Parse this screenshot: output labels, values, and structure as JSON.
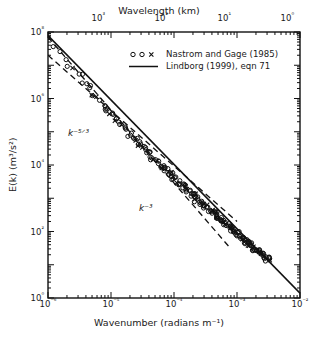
{
  "figure": {
    "top_axis_title": "Wavelength  (km)",
    "bottom_axis_title": "Wavenumber  (radians m⁻¹)",
    "y_axis_title": "E(k) (m³/s²)"
  },
  "legend": {
    "entries": [
      {
        "key": "open-circles-and-cross",
        "label": "Nastrom and Gage (1985)"
      },
      {
        "key": "solid-line",
        "label": "Lindborg (1999), eqn 71"
      }
    ]
  },
  "annotations": [
    {
      "name": "slope-label-k-minus-five-thirds",
      "text": "k⁻⁵ᐟ³",
      "x": 68,
      "y": 128
    },
    {
      "name": "slope-label-k-minus-three",
      "text": "k⁻³",
      "x": 139,
      "y": 203
    }
  ],
  "chart_data": {
    "type": "scatter",
    "title": "",
    "xlabel": "Wavenumber  (radians m⁻¹)",
    "ylabel": "E(k) (m³/s²)",
    "xscale": "log",
    "yscale": "log",
    "xlim": [
      1e-06,
      0.01
    ],
    "ylim": [
      1.0,
      100000000.0
    ],
    "grid": false,
    "legend_position": "top-right-inside",
    "x_ticks": [
      "10⁻⁶",
      "10⁻⁵",
      "10⁻⁴",
      "10⁻³",
      "10⁻²"
    ],
    "x_tick_values": [
      1e-06,
      1e-05,
      0.0001,
      0.001,
      0.01
    ],
    "y_ticks": [
      "10⁸",
      "10⁶",
      "10⁴",
      "10²",
      "10⁰"
    ],
    "y_tick_values": [
      100000000.0,
      1000000.0,
      10000.0,
      100.0,
      1.0
    ],
    "secondary_x_axis": {
      "label": "Wavelength  (km)",
      "ticks": [
        "10³",
        "10²",
        "10¹",
        "10⁰"
      ],
      "tick_values": [
        1000,
        100,
        10,
        1
      ],
      "relation": "wavelength_km = 2*pi/(1000*k)"
    },
    "series": [
      {
        "name": "Nastrom and Gage (1985)",
        "marker": "open circle / cross",
        "type": "scatter",
        "points": [
          [
            1e-06,
            63000000.0
          ],
          [
            1.2e-06,
            43000000.0
          ],
          [
            1.5e-06,
            26000000.0
          ],
          [
            1.8e-06,
            17000000.0
          ],
          [
            2.2e-06,
            11000000.0
          ],
          [
            2.6e-06,
            7400000.0
          ],
          [
            3.2e-06,
            4600000.0
          ],
          [
            3.8e-06,
            3100000.0
          ],
          [
            4.5e-06,
            2100000.0
          ],
          [
            5.4e-06,
            1400000.0
          ],
          [
            6.3e-06,
            960000.0
          ],
          [
            7.5e-06,
            660000.0
          ],
          [
            8.9e-06,
            450000.0
          ],
          [
            1e-05,
            340000.0
          ],
          [
            1.2e-05,
            240000.0
          ],
          [
            1.4e-05,
            170000.0
          ],
          [
            1.7e-05,
            120000.0
          ],
          [
            2e-05,
            82000.0
          ],
          [
            2.4e-05,
            58000.0
          ],
          [
            2.8e-05,
            42000.0
          ],
          [
            3.3e-05,
            31000.0
          ],
          [
            3.9e-05,
            23000.0
          ],
          [
            4.6e-05,
            17000.0
          ],
          [
            5.4e-05,
            13000.0
          ],
          [
            6.4e-05,
            9400.0
          ],
          [
            7.5e-05,
            7100.0
          ],
          [
            8.8e-05,
            5300.0
          ],
          [
            0.0001,
            4100.0
          ],
          [
            0.00012,
            3000.0
          ],
          [
            0.00014,
            2300.0
          ],
          [
            0.00017,
            1700.0
          ],
          [
            0.0002,
            1200.0
          ],
          [
            0.00023,
            930.0
          ],
          [
            0.00027,
            720.0
          ],
          [
            0.00032,
            550.0
          ],
          [
            0.00038,
            420.0
          ],
          [
            0.00044,
            330.0
          ],
          [
            0.00052,
            250.0
          ],
          [
            0.00061,
            190.0
          ],
          [
            0.00072,
            150.0
          ],
          [
            0.00084,
            110.0
          ],
          [
            0.001,
            87.0
          ],
          [
            0.0012,
            66.0
          ],
          [
            0.0014,
            51.0
          ],
          [
            0.0016,
            40.0
          ],
          [
            0.0019,
            31.0
          ],
          [
            0.0022,
            24.0
          ],
          [
            0.0026,
            19.0
          ],
          [
            0.003,
            15.0
          ]
        ]
      },
      {
        "name": "Lindborg (1999), eqn 71",
        "type": "line",
        "style": "solid",
        "points": [
          [
            1e-06,
            78000000.0
          ],
          [
            0.01,
            1.4
          ]
        ]
      },
      {
        "name": "k^-5/3 reference slope",
        "type": "line",
        "style": "dashed",
        "slope": -1.6667,
        "points": [
          [
            1e-06,
            20000000.0
          ],
          [
            0.001,
            200.0
          ]
        ]
      },
      {
        "name": "k^-3 reference slope",
        "type": "line",
        "style": "dashed",
        "slope": -3.0,
        "points": [
          [
            1e-06,
            70000000.0
          ],
          [
            0.0008,
            30.0
          ]
        ]
      }
    ]
  }
}
